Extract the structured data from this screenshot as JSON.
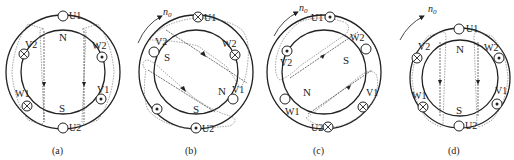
{
  "figure": {
    "panels": [
      {
        "id": "a",
        "caption": "( a )",
        "rotation_label": "",
        "poles": [
          {
            "label": "N",
            "x": 63,
            "y": 35
          },
          {
            "label": "S",
            "x": 63,
            "y": 112
          }
        ],
        "slots": [
          {
            "name": "U1",
            "symbol": "empty",
            "x": 63,
            "y": 16,
            "lx": 70,
            "ly": 19
          },
          {
            "name": "U2",
            "symbol": "empty",
            "x": 63,
            "y": 128,
            "lx": 70,
            "ly": 131
          },
          {
            "name": "V1",
            "symbol": "dot",
            "x": 101,
            "y": 99,
            "lx": 98,
            "ly": 94
          },
          {
            "name": "V2",
            "symbol": "cross",
            "x": 24,
            "y": 52,
            "lx": 25,
            "ly": 47
          },
          {
            "name": "W1",
            "symbol": "cross",
            "x": 26,
            "y": 105,
            "lx": 17,
            "ly": 96
          },
          {
            "name": "W2",
            "symbol": "dot",
            "x": 101,
            "y": 54,
            "lx": 95,
            "ly": 48
          }
        ]
      },
      {
        "id": "b",
        "caption": "( b )",
        "rotation_label": "n0",
        "poles": [
          {
            "label": "S",
            "x": 168,
            "y": 56
          },
          {
            "label": "N",
            "x": 218,
            "y": 92
          },
          {
            "label": "S",
            "x": 195,
            "y": 112
          }
        ],
        "slots": [
          {
            "name": "U1",
            "symbol": "cross",
            "x": 198,
            "y": 16,
            "lx": 205,
            "ly": 19
          },
          {
            "name": "U2",
            "symbol": "dot",
            "x": 196,
            "y": 128,
            "lx": 203,
            "ly": 131
          },
          {
            "name": "V1",
            "symbol": "empty",
            "x": 233,
            "y": 98,
            "lx": 230,
            "ly": 94
          },
          {
            "name": "V2",
            "symbol": "empty",
            "x": 154,
            "y": 52,
            "lx": 155,
            "ly": 46
          },
          {
            "name": "W1",
            "symbol": "dot",
            "x": 157,
            "y": 109,
            "lx": null,
            "ly": null
          },
          {
            "name": "W2",
            "symbol": "cross",
            "x": 233,
            "y": 54,
            "lx": 226,
            "ly": 48
          }
        ]
      },
      {
        "id": "c",
        "caption": "( c )",
        "rotation_label": "n0",
        "poles": [
          {
            "label": "S",
            "x": 345,
            "y": 60
          },
          {
            "label": "N",
            "x": 306,
            "y": 92
          }
        ],
        "slots": [
          {
            "name": "U1",
            "symbol": "dot",
            "x": 330,
            "y": 16,
            "lx": 313,
            "ly": 19
          },
          {
            "name": "U2",
            "symbol": "cross",
            "x": 328,
            "y": 127,
            "lx": 313,
            "ly": 130
          },
          {
            "name": "V1",
            "symbol": "cross",
            "x": 363,
            "y": 107,
            "lx": 367,
            "ly": 95
          },
          {
            "name": "V2",
            "symbol": "dot",
            "x": 286,
            "y": 51,
            "lx": 281,
            "ly": 64
          },
          {
            "name": "W1",
            "symbol": "empty",
            "x": 285,
            "y": 98,
            "lx": 286,
            "ly": 114
          },
          {
            "name": "W2",
            "symbol": "empty",
            "x": 366,
            "y": 48,
            "lx": 352,
            "ly": 40
          }
        ]
      },
      {
        "id": "d",
        "caption": "( d )",
        "rotation_label": "n0",
        "poles": [
          {
            "label": "N",
            "x": 460,
            "y": 50
          },
          {
            "label": "S",
            "x": 460,
            "y": 111
          }
        ],
        "slots": [
          {
            "name": "U1",
            "symbol": "empty",
            "x": 460,
            "y": 29,
            "lx": 467,
            "ly": 32
          },
          {
            "name": "U2",
            "symbol": "empty",
            "x": 459,
            "y": 125,
            "lx": 466,
            "ly": 128
          },
          {
            "name": "V1",
            "symbol": "dot",
            "x": 497,
            "y": 103,
            "lx": 497,
            "ly": 93
          },
          {
            "name": "V2",
            "symbol": "cross",
            "x": 418,
            "y": 58,
            "lx": 418,
            "ly": 48
          },
          {
            "name": "W1",
            "symbol": "cross",
            "x": 423,
            "y": 107,
            "lx": 414,
            "ly": 98
          },
          {
            "name": "W2",
            "symbol": "dot",
            "x": 499,
            "y": 58,
            "lx": 486,
            "ly": 49
          }
        ]
      }
    ]
  },
  "labels": {
    "a": {
      "caption": "(a)",
      "U1": "U1",
      "U2": "U2",
      "V1": "V1",
      "V2": "V2",
      "W1": "W1",
      "W2": "W2",
      "N": "N",
      "S": "S"
    },
    "b": {
      "caption": "(b)",
      "n0": "n",
      "n0_sub": "0",
      "U1": "U1",
      "U2": "U2",
      "V1": "V1",
      "V2": "V2",
      "W2": "W2",
      "N": "N",
      "S1": "S",
      "S2": "S"
    },
    "c": {
      "caption": "(c)",
      "n0": "n",
      "n0_sub": "0",
      "U1": "U1",
      "U2": "U2",
      "V1": "V1",
      "V2": "V2",
      "W1": "W1",
      "W2": "W2",
      "N": "N",
      "S": "S"
    },
    "d": {
      "caption": "(d)",
      "n0": "n",
      "n0_sub": "0",
      "U1": "U1",
      "U2": "U2",
      "V1": "V1",
      "V2": "V2",
      "W1": "W1",
      "W2": "W2",
      "N": "N",
      "S": "S"
    }
  },
  "colors": {
    "line": "#222222",
    "dashed": "#777777",
    "background": "#ffffff"
  }
}
